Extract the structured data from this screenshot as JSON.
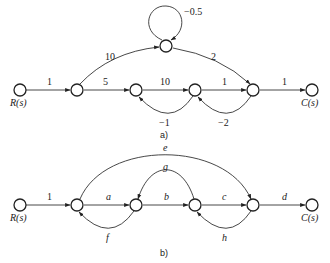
{
  "diagram_a": {
    "caption": "a)",
    "input_label": "R(s)",
    "output_label": "C(s)",
    "gains": {
      "r_to_n2": "1",
      "n2_to_top": "10",
      "top_self_loop": "−0.5",
      "top_to_n5": "2",
      "n2_to_n3": "5",
      "n3_to_n4": "10",
      "n4_to_n5": "1",
      "n5_to_c": "1",
      "n4_to_n3_feedback": "−1",
      "n5_to_n4_feedback": "−2"
    }
  },
  "diagram_b": {
    "caption": "b)",
    "input_label": "R(s)",
    "output_label": "C(s)",
    "gains": {
      "r_to_n2": "1",
      "n2_to_n3": "a",
      "n3_to_n4": "b",
      "n4_to_n5": "c",
      "n5_to_c": "d",
      "n2_to_n5_forward": "e",
      "n3_to_n2_feedback": "f",
      "n4_to_n3_feedback": "g",
      "n5_to_n4_feedback": "h"
    }
  }
}
